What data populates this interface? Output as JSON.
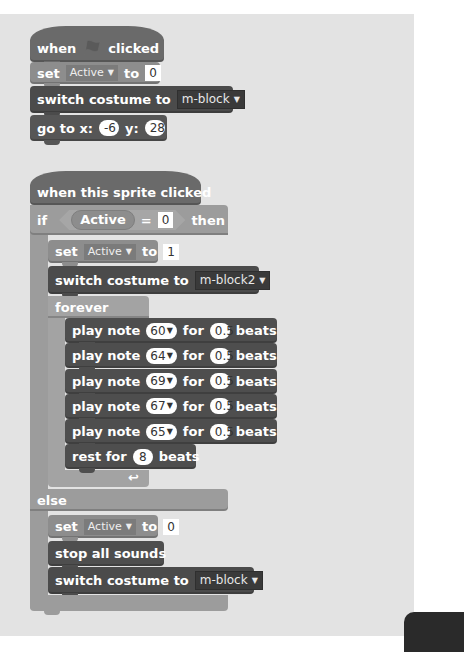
{
  "colors": {
    "panel_bg": "#e3e3e3",
    "control": "#9c9c9c",
    "data": "#8d8d8d",
    "looks": "#4b4b4b",
    "sound": "#4e4e4e",
    "motion": "#565656"
  },
  "script1": {
    "hat": {
      "when": "when",
      "icon": "green-flag-icon",
      "clicked": "clicked"
    },
    "set": {
      "label": "set",
      "variable": "Active",
      "to": "to",
      "value": "0"
    },
    "switch": {
      "label": "switch costume to",
      "costume": "m-block"
    },
    "goto": {
      "label": "go to x:",
      "x": "-6",
      "ylabel": "y:",
      "y": "28"
    }
  },
  "script2": {
    "hat": {
      "label": "when this sprite clicked"
    },
    "if": {
      "if_label": "if",
      "variable": "Active",
      "operator": "=",
      "compare_value": "0",
      "then_label": "then"
    },
    "then_branch": {
      "set": {
        "label": "set",
        "variable": "Active",
        "to": "to",
        "value": "1"
      },
      "switch": {
        "label": "switch costume to",
        "costume": "m-block2"
      },
      "forever": {
        "label": "forever",
        "notes": [
          {
            "play": "play note",
            "note": "60",
            "for": "for",
            "beats_value": "0.5",
            "beats": "beats"
          },
          {
            "play": "play note",
            "note": "64",
            "for": "for",
            "beats_value": "0.5",
            "beats": "beats"
          },
          {
            "play": "play note",
            "note": "69",
            "for": "for",
            "beats_value": "0.5",
            "beats": "beats"
          },
          {
            "play": "play note",
            "note": "67",
            "for": "for",
            "beats_value": "0.5",
            "beats": "beats"
          },
          {
            "play": "play note",
            "note": "65",
            "for": "for",
            "beats_value": "0.5",
            "beats": "beats"
          }
        ],
        "rest": {
          "label": "rest for",
          "value": "8",
          "beats": "beats"
        },
        "loop_icon": "↩"
      }
    },
    "else_label": "else",
    "else_branch": {
      "set": {
        "label": "set",
        "variable": "Active",
        "to": "to",
        "value": "0"
      },
      "stop": {
        "label": "stop all sounds"
      },
      "switch": {
        "label": "switch costume to",
        "costume": "m-block"
      }
    }
  }
}
